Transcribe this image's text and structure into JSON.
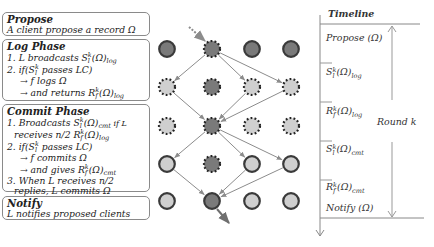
{
  "phases": [
    {
      "id": "propose",
      "title": "Propose",
      "lines": [
        {
          "text": "A client propose a record Ω",
          "indent": 0
        }
      ]
    },
    {
      "id": "log",
      "title": "Log Phase",
      "lines": [
        {
          "pre": "1. L broadcasts S",
          "sup": "k",
          "sub1": "l",
          "post": "(Ω)",
          "sub2": "log",
          "tail": "",
          "indent": 0
        },
        {
          "pre": "2. if(S",
          "sup": "k",
          "sub1": "l",
          "post": " passes LC)",
          "sub2": "",
          "tail": "",
          "indent": 0
        },
        {
          "text": "→ f logs Ω",
          "indent": 2
        },
        {
          "pre": "→ and returns R",
          "sup": "k",
          "sub1": "f",
          "post": "(Ω)",
          "sub2": "log",
          "tail": "",
          "indent": 2
        }
      ]
    },
    {
      "id": "commit",
      "title": "Commit Phase",
      "lines": [
        {
          "pre": "1. Broadcasts S",
          "sup": "k",
          "sub1": "l",
          "post": "(Ω)",
          "sub2": "cmt",
          "tail": " if L",
          "indent": 0
        },
        {
          "pre": "receives n/2 R",
          "sup": "k",
          "sub1": "f",
          "post": "(Ω)",
          "sub2": "log",
          "tail": "",
          "indent": 1
        },
        {
          "pre": "2. if(S",
          "sup": "k",
          "sub1": "l",
          "post": " passes LC)",
          "sub2": "",
          "tail": "",
          "indent": 0
        },
        {
          "text": "→ f commits Ω",
          "indent": 2
        },
        {
          "pre": "→ and gives R",
          "sup": "k",
          "sub1": "f",
          "post": "(Ω)",
          "sub2": "cmt",
          "tail": "",
          "indent": 2
        },
        {
          "text": "3. When L receives n/2",
          "indent": 0
        },
        {
          "text": "replies, L commits Ω",
          "indent": 1
        }
      ]
    },
    {
      "id": "notify",
      "title": "Notify",
      "lines": [
        {
          "text": "L notifies proposed clients",
          "indent": 0
        }
      ]
    }
  ],
  "nodes": {
    "columns": 4,
    "leader_column": 1,
    "rows": [
      {
        "stage": "propose",
        "style": [
          "solid-dark",
          "dashed-dark",
          "solid-dark",
          "solid-dark"
        ]
      },
      {
        "stage": "log-broadcast",
        "style": [
          "dashed-light",
          "dashed-dark",
          "dashed-light",
          "dashed-light"
        ]
      },
      {
        "stage": "log-return",
        "style": [
          "dashed-light",
          "dashed-dark",
          "dashed-light",
          "dashed-light"
        ]
      },
      {
        "stage": "commit-broadcast",
        "style": [
          "solid-light",
          "dashed-dark",
          "solid-light",
          "solid-light"
        ]
      },
      {
        "stage": "notify",
        "style": [
          "solid-light",
          "solid-dark",
          "solid-light",
          "solid-light"
        ]
      }
    ],
    "messages": [
      {
        "from": [
          0,
          1
        ],
        "to": [
          1,
          0
        ]
      },
      {
        "from": [
          0,
          1
        ],
        "to": [
          1,
          2
        ]
      },
      {
        "from": [
          0,
          1
        ],
        "to": [
          1,
          3
        ]
      },
      {
        "from": [
          1,
          0
        ],
        "to": [
          2,
          1
        ]
      },
      {
        "from": [
          1,
          2
        ],
        "to": [
          2,
          1
        ]
      },
      {
        "from": [
          1,
          3
        ],
        "to": [
          2,
          1
        ]
      },
      {
        "from": [
          2,
          1
        ],
        "to": [
          3,
          0
        ]
      },
      {
        "from": [
          2,
          1
        ],
        "to": [
          3,
          2
        ]
      },
      {
        "from": [
          2,
          1
        ],
        "to": [
          3,
          3
        ]
      },
      {
        "from": [
          3,
          0
        ],
        "to": [
          4,
          1
        ]
      },
      {
        "from": [
          3,
          2
        ],
        "to": [
          4,
          1
        ]
      },
      {
        "from": [
          3,
          3
        ],
        "to": [
          4,
          1
        ]
      }
    ],
    "colors": {
      "dark_fill": "#7a7a7a",
      "light_fill": "#cfcfcf",
      "outline": "#3a3a3a",
      "arrow": "#8c8c8c",
      "incoming_arrow": "#8c8c8c",
      "outgoing_arrow": "#6f6f6f"
    }
  },
  "timeline": {
    "title": "Timeline",
    "round_label": "Round k",
    "steps": [
      {
        "pre": "Propose (Ω)",
        "sup": "",
        "sub1": "",
        "post": "",
        "sub2": ""
      },
      {
        "pre": "S",
        "sup": "k",
        "sub1": "l",
        "post": "(Ω)",
        "sub2": "log"
      },
      {
        "pre": "R",
        "sup": "k",
        "sub1": "f",
        "post": "(Ω)",
        "sub2": "log"
      },
      {
        "pre": "S",
        "sup": "k",
        "sub1": "l",
        "post": "(Ω)",
        "sub2": "cmt"
      },
      {
        "pre": "R",
        "sup": "k",
        "sub1": "f",
        "post": "(Ω)",
        "sub2": "cmt"
      },
      {
        "pre": "Notify (Ω)",
        "sup": "",
        "sub1": "",
        "post": "",
        "sub2": ""
      }
    ]
  }
}
